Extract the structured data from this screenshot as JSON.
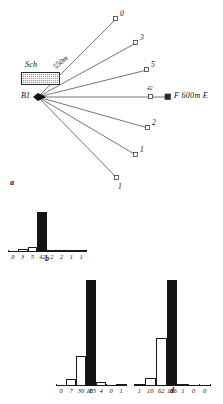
{
  "figure": {
    "panels": [
      {
        "id": "a",
        "letter": "a"
      },
      {
        "id": "b",
        "letter": "b"
      },
      {
        "id": "c",
        "letter": "c"
      },
      {
        "id": "d",
        "letter": "d"
      }
    ]
  },
  "panel_a": {
    "origin_label": "B1",
    "building_label": "Sch",
    "distance_label": "550m",
    "target_label": "F 600m E",
    "rays": [
      {
        "label": "0",
        "marker": "open-square"
      },
      {
        "label": "3",
        "marker": "open-square"
      },
      {
        "label": "5",
        "marker": "open-square"
      },
      {
        "label": "42",
        "marker": "open-square"
      },
      {
        "label": "2",
        "marker": "open-square"
      },
      {
        "label": "1",
        "marker": "open-square"
      },
      {
        "label": "1",
        "marker": "open-square"
      }
    ]
  },
  "chart_data": [
    {
      "type": "bar",
      "id": "b",
      "title": "b",
      "categories": [
        "0",
        "3",
        "5",
        "42",
        "2",
        "2",
        "1",
        "1"
      ],
      "values": [
        0,
        3,
        5,
        42,
        2,
        2,
        1,
        1
      ],
      "highlight_index": 3,
      "xlabel": "",
      "ylabel": "",
      "ylim": [
        0,
        42
      ],
      "grid": false,
      "legend": "none"
    },
    {
      "type": "bar",
      "id": "c",
      "title": "c",
      "categories": [
        "0",
        "7",
        "30",
        "105",
        "4",
        "0",
        "1"
      ],
      "values": [
        0,
        7,
        30,
        105,
        4,
        0,
        1
      ],
      "highlight_index": 3,
      "xlabel": "",
      "ylabel": "",
      "ylim": [
        0,
        105
      ],
      "grid": false,
      "legend": "none"
    },
    {
      "type": "bar",
      "id": "d",
      "title": "d",
      "categories": [
        "1",
        "10",
        "62",
        "136",
        "1",
        "0",
        "0"
      ],
      "values": [
        1,
        10,
        62,
        136,
        1,
        0,
        0
      ],
      "highlight_index": 3,
      "xlabel": "",
      "ylabel": "",
      "ylim": [
        0,
        136
      ],
      "grid": false,
      "legend": "none"
    }
  ]
}
